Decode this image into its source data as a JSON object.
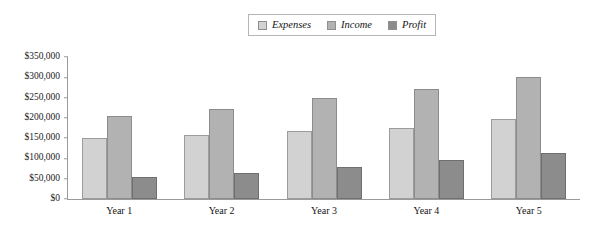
{
  "chart_data": {
    "type": "bar",
    "title": "",
    "subtitle": "",
    "xlabel": "",
    "ylabel": "",
    "categories": [
      "Year 1",
      "Year 2",
      "Year 3",
      "Year 4",
      "Year 5"
    ],
    "series": [
      {
        "name": "Expenses",
        "color": "#d2d2d2",
        "values": [
          150000,
          157000,
          168000,
          175000,
          198000
        ]
      },
      {
        "name": "Income",
        "color": "#b2b2b2",
        "values": [
          205000,
          222000,
          250000,
          272000,
          300000
        ]
      },
      {
        "name": "Profit",
        "color": "#8c8c8c",
        "values": [
          55000,
          65000,
          78000,
          95000,
          113000
        ]
      }
    ],
    "ylim": [
      0,
      350000
    ],
    "ytick_step": 50000,
    "ytick_labels": [
      "$0",
      "$50,000",
      "$100,000",
      "$150,000",
      "$200,000",
      "$250,000",
      "$300,000",
      "$350,000"
    ],
    "ytick_values": [
      0,
      50000,
      100000,
      150000,
      200000,
      250000,
      300000,
      350000
    ],
    "grid": false,
    "legend_position": "top-center",
    "legend_entries": [
      "Expenses",
      "Income",
      "Profit"
    ],
    "annotations": []
  },
  "legend": {
    "items": [
      {
        "label": "Expenses",
        "swatch": "legend-swatch-expenses"
      },
      {
        "label": "Income",
        "swatch": "legend-swatch-income"
      },
      {
        "label": "Profit",
        "swatch": "legend-swatch-profit"
      }
    ]
  }
}
